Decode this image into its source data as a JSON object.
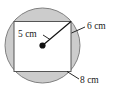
{
  "figure": {
    "type": "geometry-diagram",
    "colors": {
      "circle_fill": "#cccccc",
      "circle_stroke": "#808080",
      "rectangle_fill": "#ffffff",
      "rectangle_stroke": "#555555",
      "line_color": "#111111",
      "text_color": "#1a1a1a",
      "background": "#ffffff"
    },
    "shapes": {
      "circle": {
        "name": "circle",
        "center_x": 42.5,
        "center_y": 45.5,
        "radius": 37.5
      },
      "rectangle": {
        "name": "inscribed-rectangle",
        "left": 14,
        "top": 21.5,
        "width": 57,
        "height": 50
      },
      "center_dot": {
        "name": "center-point",
        "cx": 42.5,
        "cy": 45.5,
        "r": 3.1
      },
      "radius_line": {
        "name": "radius-segment",
        "x1": 42.5,
        "y1": 45.5,
        "x2": 71,
        "y2": 21.5
      }
    },
    "labels": [
      {
        "id": "radius-label",
        "text": "5 cm",
        "x": 18,
        "y": 35,
        "leader": {
          "x1": 43,
          "y1": 35,
          "x2": 50,
          "y2": 39.5
        }
      },
      {
        "id": "height-label",
        "text": "6 cm",
        "x": 87,
        "y": 27,
        "leader": {
          "x1": 85,
          "y1": 27,
          "x2": 71.5,
          "y2": 33
        }
      },
      {
        "id": "width-label",
        "text": "8 cm",
        "x": 80,
        "y": 81,
        "leader": {
          "x1": 79,
          "y1": 79,
          "x2": 67,
          "y2": 71.5
        }
      }
    ]
  }
}
